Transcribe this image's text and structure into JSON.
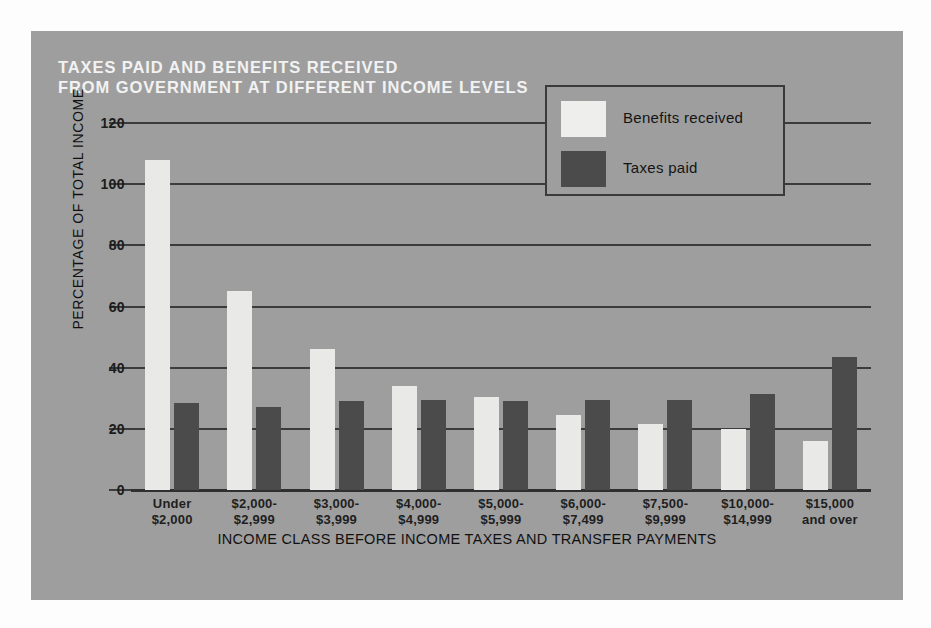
{
  "chart_data": {
    "type": "bar",
    "title": "TAXES PAID AND BENEFITS RECEIVED FROM GOVERNMENT AT DIFFERENT INCOME LEVELS",
    "title_lines": [
      "TAXES PAID AND BENEFITS RECEIVED",
      "FROM GOVERNMENT AT DIFFERENT INCOME LEVELS"
    ],
    "xlabel": "INCOME CLASS BEFORE INCOME TAXES AND TRANSFER PAYMENTS",
    "ylabel": "PERCENTAGE OF TOTAL INCOME",
    "ylim": [
      0,
      120
    ],
    "yticks": [
      0,
      20,
      40,
      60,
      80,
      100,
      120
    ],
    "ytick_labels": [
      "0",
      "20",
      "40",
      "60",
      "80",
      "100",
      "120"
    ],
    "grid": true,
    "legend_position": "upper right",
    "categories": [
      "Under $2,000",
      "$2,000-$2,999",
      "$3,000-$3,999",
      "$4,000-$4,999",
      "$5,000-$5,999",
      "$6,000-$7,499",
      "$7,500-$9,999",
      "$10,000-$14,999",
      "$15,000 and over"
    ],
    "category_lines": [
      [
        "Under",
        "$2,000"
      ],
      [
        "$2,000-",
        "$2,999"
      ],
      [
        "$3,000-",
        "$3,999"
      ],
      [
        "$4,000-",
        "$4,999"
      ],
      [
        "$5,000-",
        "$5,999"
      ],
      [
        "$6,000-",
        "$7,499"
      ],
      [
        "$7,500-",
        "$9,999"
      ],
      [
        "$10,000-",
        "$14,999"
      ],
      [
        "$15,000",
        "and over"
      ]
    ],
    "series": [
      {
        "name": "Benefits received",
        "color": "#e9e9e7",
        "values": [
          108,
          65,
          46,
          34,
          30.5,
          24.5,
          21.5,
          20,
          16
        ]
      },
      {
        "name": "Taxes paid",
        "color": "#4b4b4b",
        "values": [
          28.5,
          27,
          29,
          29.5,
          29,
          29.5,
          29.5,
          31.5,
          43.5
        ]
      }
    ]
  },
  "legend": {
    "items": [
      {
        "label": "Benefits received",
        "swatch": "benefits"
      },
      {
        "label": "Taxes paid",
        "swatch": "taxes"
      }
    ]
  },
  "colors": {
    "panel_background": "#9e9e9e",
    "page_background": "#fdfdfd",
    "title_text": "#f2f2f2",
    "axis_text": "#1c1c1c",
    "gridline": "#3b3b3b",
    "benefits_bar": "#e9e9e7",
    "taxes_bar": "#4b4b4b",
    "legend_border": "#3a3a3a"
  }
}
